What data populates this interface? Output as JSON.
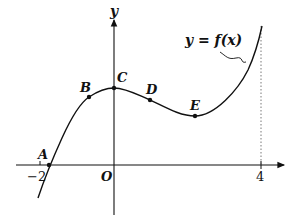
{
  "figure": {
    "axis_labels": {
      "y": "y",
      "origin": "O"
    },
    "ticks": {
      "x_neg": "−2",
      "x_pos": "4"
    },
    "function_label": "y = f(x)",
    "points": [
      {
        "label": "A",
        "x": 49,
        "y": 165
      },
      {
        "label": "B",
        "x": 89,
        "y": 97
      },
      {
        "label": "C",
        "x": 114,
        "y": 88
      },
      {
        "label": "D",
        "x": 150,
        "y": 100
      },
      {
        "label": "E",
        "x": 195,
        "y": 116
      }
    ],
    "colors": {
      "ink": "#111111",
      "background": "#ffffff"
    }
  }
}
